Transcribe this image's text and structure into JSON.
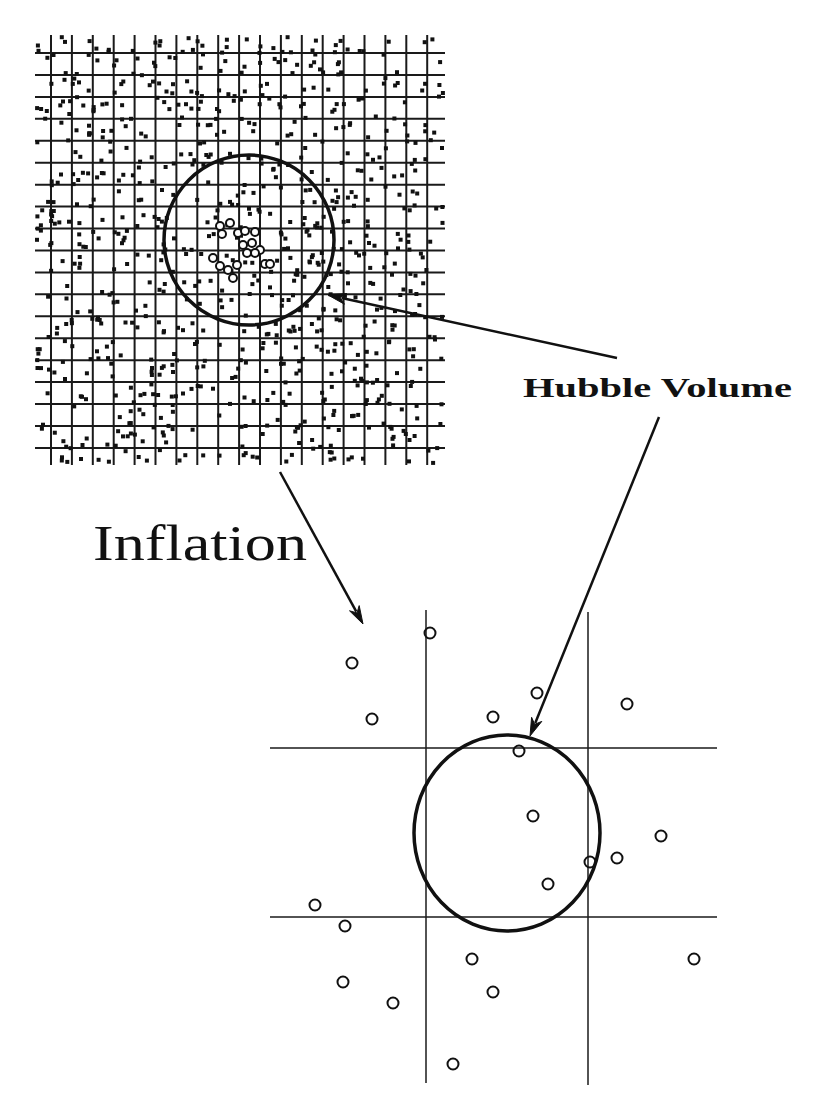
{
  "labels": {
    "hubble_volume": "Hubble Volume",
    "inflation": "Inflation"
  },
  "colors": {
    "ink": "#111111",
    "background": "#ffffff"
  },
  "top_panel": {
    "description": "Pre-inflation universe: dense grid with many random point-like regions",
    "bounds": {
      "x0": 35,
      "y0": 35,
      "x1": 445,
      "y1": 465
    },
    "vertical_lines": {
      "count": 19,
      "start": 51,
      "spacing": 20.9
    },
    "horizontal_lines": {
      "count": 19,
      "start": 53,
      "spacing": 21.94
    },
    "random_dots": {
      "count": 820,
      "seed": 7,
      "size": 4
    },
    "hubble_circle": {
      "cx": 249,
      "cy": 240,
      "r": 85
    },
    "cluster_circles": [
      {
        "cx": 220,
        "cy": 226
      },
      {
        "cx": 230,
        "cy": 223
      },
      {
        "cx": 222,
        "cy": 234
      },
      {
        "cx": 238,
        "cy": 233
      },
      {
        "cx": 245,
        "cy": 231
      },
      {
        "cx": 255,
        "cy": 232
      },
      {
        "cx": 243,
        "cy": 245
      },
      {
        "cx": 252,
        "cy": 243
      },
      {
        "cx": 260,
        "cy": 250
      },
      {
        "cx": 247,
        "cy": 253
      },
      {
        "cx": 255,
        "cy": 253
      },
      {
        "cx": 213,
        "cy": 258
      },
      {
        "cx": 220,
        "cy": 266
      },
      {
        "cx": 228,
        "cy": 270
      },
      {
        "cx": 237,
        "cy": 265
      },
      {
        "cx": 233,
        "cy": 278
      },
      {
        "cx": 265,
        "cy": 264
      },
      {
        "cx": 270,
        "cy": 264
      }
    ],
    "cluster_circle_r": 4
  },
  "bottom_panel": {
    "description": "Post-inflation: a few grid cells greatly expanded, Hubble volume containing few regions",
    "vertical_lines": [
      {
        "x": 426,
        "y0": 610,
        "y1": 1083
      },
      {
        "x": 588,
        "y0": 612,
        "y1": 1085
      }
    ],
    "horizontal_lines": [
      {
        "y": 748,
        "x0": 270,
        "x1": 717
      },
      {
        "y": 917,
        "x0": 270,
        "x1": 717
      }
    ],
    "hubble_ellipse": {
      "cx": 507,
      "cy": 833,
      "rx": 93,
      "ry": 98
    },
    "circles": [
      {
        "cx": 430,
        "cy": 633
      },
      {
        "cx": 352,
        "cy": 663
      },
      {
        "cx": 372,
        "cy": 719
      },
      {
        "cx": 493,
        "cy": 717
      },
      {
        "cx": 537,
        "cy": 693
      },
      {
        "cx": 627,
        "cy": 704
      },
      {
        "cx": 519,
        "cy": 751
      },
      {
        "cx": 533,
        "cy": 816
      },
      {
        "cx": 661,
        "cy": 836
      },
      {
        "cx": 590,
        "cy": 862
      },
      {
        "cx": 617,
        "cy": 858
      },
      {
        "cx": 548,
        "cy": 884
      },
      {
        "cx": 315,
        "cy": 905
      },
      {
        "cx": 345,
        "cy": 926
      },
      {
        "cx": 472,
        "cy": 959
      },
      {
        "cx": 694,
        "cy": 959
      },
      {
        "cx": 343,
        "cy": 982
      },
      {
        "cx": 493,
        "cy": 992
      },
      {
        "cx": 393,
        "cy": 1003
      },
      {
        "cx": 453,
        "cy": 1064
      }
    ],
    "circle_r": 5.5
  },
  "arrows": [
    {
      "name": "hubble-to-top-circle-arrow",
      "x1": 617,
      "y1": 358,
      "x2": 328,
      "y2": 295
    },
    {
      "name": "hubble-to-bottom-circle-arrow",
      "x1": 659,
      "y1": 417,
      "x2": 530,
      "y2": 736
    },
    {
      "name": "inflation-arrow",
      "x1": 280,
      "y1": 472,
      "x2": 363,
      "y2": 624
    }
  ],
  "text_positions": {
    "hubble_volume": {
      "x": 523,
      "y": 397,
      "size": 28,
      "width": 269
    },
    "inflation": {
      "x": 93,
      "y": 560,
      "size": 50,
      "width": 214
    }
  }
}
